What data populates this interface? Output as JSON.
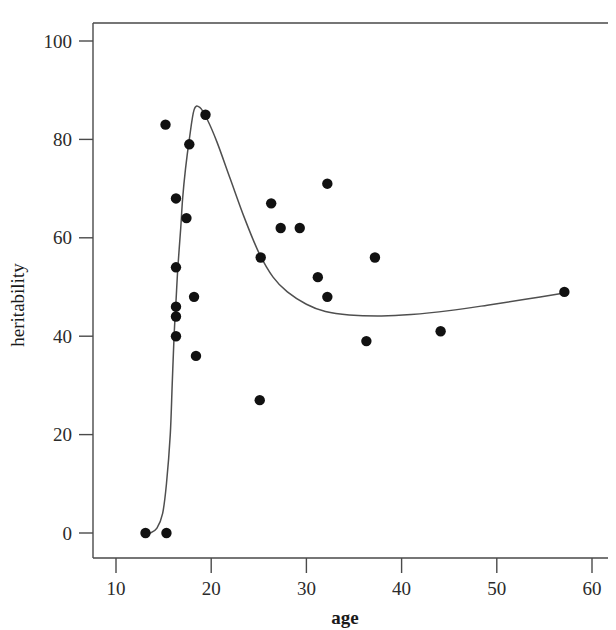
{
  "chart_data": {
    "type": "scatter",
    "title": "",
    "subtitle": "",
    "xlabel": "age",
    "ylabel": "heritability",
    "xlim": [
      7.5,
      62
    ],
    "ylim": [
      -4,
      106
    ],
    "xticks": [
      10,
      20,
      30,
      40,
      50,
      60
    ],
    "yticks": [
      0,
      20,
      40,
      60,
      80,
      100
    ],
    "xtick_labels": [
      "10",
      "20",
      "30",
      "40",
      "50",
      "60"
    ],
    "ytick_labels": [
      "0",
      "20",
      "40",
      "60",
      "80",
      "100"
    ],
    "grid": false,
    "legend": null,
    "legend_position": "none",
    "point_color": "#111111",
    "curve_color": "#4f4f4f",
    "frame_color": "#4a4a4a",
    "points": [
      {
        "x": 13.1,
        "y": 0
      },
      {
        "x": 15.3,
        "y": 0
      },
      {
        "x": 15.2,
        "y": 83
      },
      {
        "x": 16.3,
        "y": 68
      },
      {
        "x": 16.3,
        "y": 54
      },
      {
        "x": 16.3,
        "y": 46
      },
      {
        "x": 16.3,
        "y": 44
      },
      {
        "x": 16.3,
        "y": 40
      },
      {
        "x": 17.4,
        "y": 64
      },
      {
        "x": 17.7,
        "y": 79
      },
      {
        "x": 18.2,
        "y": 48
      },
      {
        "x": 18.4,
        "y": 36
      },
      {
        "x": 19.4,
        "y": 85
      },
      {
        "x": 25.1,
        "y": 27
      },
      {
        "x": 25.2,
        "y": 56
      },
      {
        "x": 26.3,
        "y": 67
      },
      {
        "x": 27.3,
        "y": 62
      },
      {
        "x": 29.3,
        "y": 62
      },
      {
        "x": 31.2,
        "y": 52
      },
      {
        "x": 32.2,
        "y": 71
      },
      {
        "x": 32.2,
        "y": 48
      },
      {
        "x": 36.3,
        "y": 39
      },
      {
        "x": 37.2,
        "y": 56
      },
      {
        "x": 44.1,
        "y": 41
      },
      {
        "x": 57.1,
        "y": 49
      }
    ],
    "fit_curve": [
      {
        "x": 13.2,
        "y": 0.2
      },
      {
        "x": 13.6,
        "y": 0.0
      },
      {
        "x": 14.3,
        "y": 1.0
      },
      {
        "x": 14.9,
        "y": 4.0
      },
      {
        "x": 15.3,
        "y": 10.0
      },
      {
        "x": 15.7,
        "y": 20.0
      },
      {
        "x": 15.9,
        "y": 30.0
      },
      {
        "x": 16.1,
        "y": 40.0
      },
      {
        "x": 16.3,
        "y": 47.0
      },
      {
        "x": 16.5,
        "y": 54.0
      },
      {
        "x": 16.8,
        "y": 62.0
      },
      {
        "x": 17.0,
        "y": 68.0
      },
      {
        "x": 17.3,
        "y": 74.0
      },
      {
        "x": 17.7,
        "y": 80.0
      },
      {
        "x": 18.2,
        "y": 86.0
      },
      {
        "x": 18.8,
        "y": 86.5
      },
      {
        "x": 19.6,
        "y": 84.0
      },
      {
        "x": 20.6,
        "y": 79.5
      },
      {
        "x": 22.0,
        "y": 72.0
      },
      {
        "x": 23.5,
        "y": 64.0
      },
      {
        "x": 25.0,
        "y": 57.0
      },
      {
        "x": 26.5,
        "y": 52.0
      },
      {
        "x": 28.0,
        "y": 49.0
      },
      {
        "x": 30.0,
        "y": 46.5
      },
      {
        "x": 32.0,
        "y": 45.0
      },
      {
        "x": 34.5,
        "y": 44.3
      },
      {
        "x": 37.9,
        "y": 44.1
      },
      {
        "x": 41.0,
        "y": 44.4
      },
      {
        "x": 45.0,
        "y": 45.2
      },
      {
        "x": 49.0,
        "y": 46.3
      },
      {
        "x": 53.0,
        "y": 47.5
      },
      {
        "x": 57.1,
        "y": 48.8
      }
    ]
  },
  "labels": {
    "x_axis_title": "age",
    "y_axis_title": "heritability"
  }
}
